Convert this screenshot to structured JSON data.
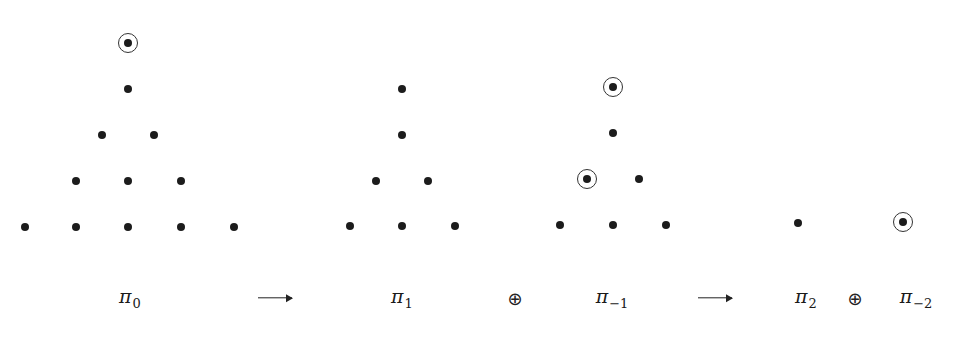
{
  "diagram": {
    "colors": {
      "dot": "#1c1c1c",
      "ring": "#333333",
      "background": "#ffffff"
    },
    "groups": [
      {
        "id": "pi0",
        "dots": [
          {
            "x": 128,
            "y": 43,
            "circled": true
          },
          {
            "x": 128,
            "y": 89,
            "circled": false
          },
          {
            "x": 102,
            "y": 135,
            "circled": false
          },
          {
            "x": 154,
            "y": 135,
            "circled": false
          },
          {
            "x": 76,
            "y": 181,
            "circled": false
          },
          {
            "x": 128,
            "y": 181,
            "circled": false
          },
          {
            "x": 181,
            "y": 181,
            "circled": false
          },
          {
            "x": 25,
            "y": 227,
            "circled": false
          },
          {
            "x": 76,
            "y": 227,
            "circled": false
          },
          {
            "x": 128,
            "y": 227,
            "circled": false
          },
          {
            "x": 181,
            "y": 227,
            "circled": false
          },
          {
            "x": 234,
            "y": 227,
            "circled": false
          }
        ]
      },
      {
        "id": "pi1",
        "dots": [
          {
            "x": 402,
            "y": 89,
            "circled": false
          },
          {
            "x": 402,
            "y": 135,
            "circled": false
          },
          {
            "x": 376,
            "y": 181,
            "circled": false
          },
          {
            "x": 428,
            "y": 181,
            "circled": false
          },
          {
            "x": 350,
            "y": 226,
            "circled": false
          },
          {
            "x": 402,
            "y": 226,
            "circled": false
          },
          {
            "x": 455,
            "y": 226,
            "circled": false
          }
        ]
      },
      {
        "id": "pi_minus1",
        "dots": [
          {
            "x": 613,
            "y": 87,
            "circled": true
          },
          {
            "x": 613,
            "y": 133,
            "circled": false
          },
          {
            "x": 587,
            "y": 179,
            "circled": true
          },
          {
            "x": 639,
            "y": 179,
            "circled": false
          },
          {
            "x": 560,
            "y": 225,
            "circled": false
          },
          {
            "x": 613,
            "y": 225,
            "circled": false
          },
          {
            "x": 666,
            "y": 225,
            "circled": false
          }
        ]
      },
      {
        "id": "pi2",
        "dots": [
          {
            "x": 798,
            "y": 223,
            "circled": false
          }
        ]
      },
      {
        "id": "pi_minus2",
        "dots": [
          {
            "x": 903,
            "y": 222,
            "circled": true
          }
        ]
      }
    ],
    "labels": [
      {
        "name": "label-pi0",
        "symbol": "π",
        "subscript": "0",
        "x": 130,
        "y": 298
      },
      {
        "name": "label-pi1",
        "symbol": "π",
        "subscript": "1",
        "x": 402,
        "y": 298
      },
      {
        "name": "label-pi-minus1",
        "symbol": "π",
        "subscript": "−1",
        "x": 612,
        "y": 298
      },
      {
        "name": "label-pi2",
        "symbol": "π",
        "subscript": "2",
        "x": 806,
        "y": 298
      },
      {
        "name": "label-pi-minus2",
        "symbol": "π",
        "subscript": "−2",
        "x": 916,
        "y": 298
      }
    ],
    "operators": [
      {
        "name": "direct-sum-1",
        "glyph": "⊕",
        "x": 515,
        "y": 298
      },
      {
        "name": "direct-sum-2",
        "glyph": "⊕",
        "x": 855,
        "y": 298
      }
    ],
    "arrows": [
      {
        "name": "arrow-1",
        "x1": 258,
        "x2": 292,
        "y": 298
      },
      {
        "name": "arrow-2",
        "x1": 698,
        "x2": 732,
        "y": 298
      }
    ]
  }
}
